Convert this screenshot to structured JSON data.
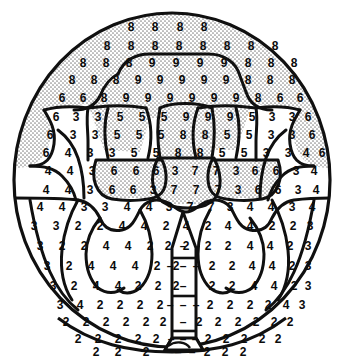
{
  "figure": {
    "kind": "paint-by-numbers-region-map",
    "outline_shape": "circle",
    "colors": {
      "ink": "#0b0b0b",
      "paper": "#ffffff",
      "stipple_fill": "#d9d9d9"
    },
    "legend_numbers": [
      "2",
      "3",
      "4",
      "5",
      "6",
      "7",
      "8",
      "9"
    ],
    "dash_mark": "–"
  },
  "regions": [
    {
      "id": "canopy-outer-top",
      "number": "8",
      "shaded": true,
      "name": "outer-canopy-top"
    },
    {
      "id": "canopy-inner-top",
      "number": "9",
      "shaded": true,
      "name": "inner-canopy-top"
    },
    {
      "id": "canopy-side-left",
      "number": "6",
      "shaded": true,
      "name": "canopy-side-left"
    },
    {
      "id": "canopy-side-right",
      "number": "6",
      "shaded": true,
      "name": "canopy-side-right"
    },
    {
      "id": "mid-left-3",
      "number": "3",
      "shaded": false,
      "name": "mid-band-left"
    },
    {
      "id": "mid-right-3",
      "number": "3",
      "shaded": false,
      "name": "mid-band-right"
    },
    {
      "id": "leaf-left-5",
      "number": "5",
      "shaded": false,
      "name": "leaf-cluster-left"
    },
    {
      "id": "leaf-right-5",
      "number": "5",
      "shaded": false,
      "name": "leaf-cluster-right"
    },
    {
      "id": "center-8",
      "number": "8",
      "shaded": true,
      "name": "center-upper-lobe"
    },
    {
      "id": "center-7",
      "number": "7",
      "shaded": true,
      "name": "center-lower-lobe"
    },
    {
      "id": "pod-left-6",
      "number": "6",
      "shaded": true,
      "name": "pod-left"
    },
    {
      "id": "pod-right-6",
      "number": "6",
      "shaded": true,
      "name": "pod-right"
    },
    {
      "id": "flank-left-4",
      "number": "4",
      "shaded": false,
      "name": "flank-left"
    },
    {
      "id": "flank-right-4",
      "number": "4",
      "shaded": false,
      "name": "flank-right"
    },
    {
      "id": "lower-left-4",
      "number": "4",
      "shaded": false,
      "name": "lower-cluster-left"
    },
    {
      "id": "lower-right-4",
      "number": "4",
      "shaded": false,
      "name": "lower-cluster-right"
    },
    {
      "id": "lower-left-2",
      "number": "2",
      "shaded": false,
      "name": "lower-field-left"
    },
    {
      "id": "lower-right-2",
      "number": "2",
      "shaded": false,
      "name": "lower-field-right"
    },
    {
      "id": "ground-2",
      "number": "2",
      "shaded": false,
      "name": "ground-field"
    },
    {
      "id": "trunk",
      "number": "–",
      "shaded": false,
      "name": "trunk-column"
    }
  ],
  "grid": {
    "rows": [
      {
        "y": 27,
        "cells": [
          {
            "x": 131,
            "v": "8"
          },
          {
            "x": 155,
            "v": "8"
          },
          {
            "x": 180,
            "v": "8"
          },
          {
            "x": 204,
            "v": "8"
          }
        ]
      },
      {
        "y": 46,
        "cells": [
          {
            "x": 107,
            "v": "8"
          },
          {
            "x": 131,
            "v": "8"
          },
          {
            "x": 155,
            "v": "8"
          },
          {
            "x": 179,
            "v": "8"
          },
          {
            "x": 203,
            "v": "8"
          },
          {
            "x": 227,
            "v": "8"
          },
          {
            "x": 251,
            "v": "8"
          },
          {
            "x": 275,
            "v": "8"
          }
        ]
      },
      {
        "y": 63,
        "cells": [
          {
            "x": 83,
            "v": "8"
          },
          {
            "x": 106,
            "v": "8"
          },
          {
            "x": 129,
            "v": "8"
          },
          {
            "x": 152,
            "v": "9"
          },
          {
            "x": 176,
            "v": "9"
          },
          {
            "x": 200,
            "v": "9"
          },
          {
            "x": 224,
            "v": "9"
          },
          {
            "x": 248,
            "v": "8"
          },
          {
            "x": 271,
            "v": "8"
          },
          {
            "x": 294,
            "v": "8"
          }
        ]
      },
      {
        "y": 80,
        "cells": [
          {
            "x": 72,
            "v": "8"
          },
          {
            "x": 94,
            "v": "8"
          },
          {
            "x": 116,
            "v": "8"
          },
          {
            "x": 138,
            "v": "9"
          },
          {
            "x": 160,
            "v": "9"
          },
          {
            "x": 182,
            "v": "9"
          },
          {
            "x": 204,
            "v": "9"
          },
          {
            "x": 226,
            "v": "9"
          },
          {
            "x": 248,
            "v": "8"
          },
          {
            "x": 270,
            "v": "8"
          },
          {
            "x": 292,
            "v": "8"
          }
        ]
      },
      {
        "y": 98,
        "cells": [
          {
            "x": 62,
            "v": "6"
          },
          {
            "x": 83,
            "v": "6"
          },
          {
            "x": 104,
            "v": "8"
          },
          {
            "x": 126,
            "v": "9"
          },
          {
            "x": 148,
            "v": "9"
          },
          {
            "x": 170,
            "v": "9"
          },
          {
            "x": 192,
            "v": "9"
          },
          {
            "x": 214,
            "v": "9"
          },
          {
            "x": 236,
            "v": "9"
          },
          {
            "x": 258,
            "v": "8"
          },
          {
            "x": 280,
            "v": "6"
          },
          {
            "x": 300,
            "v": "6"
          }
        ]
      },
      {
        "y": 117,
        "cells": [
          {
            "x": 56,
            "v": "6"
          },
          {
            "x": 76,
            "v": "3"
          },
          {
            "x": 98,
            "v": "3"
          },
          {
            "x": 120,
            "v": "5"
          },
          {
            "x": 142,
            "v": "5"
          },
          {
            "x": 164,
            "v": "5"
          },
          {
            "x": 186,
            "v": "9"
          },
          {
            "x": 208,
            "v": "9"
          },
          {
            "x": 230,
            "v": "9"
          },
          {
            "x": 252,
            "v": "5"
          },
          {
            "x": 272,
            "v": "3"
          },
          {
            "x": 292,
            "v": "3"
          },
          {
            "x": 308,
            "v": "6"
          }
        ]
      },
      {
        "y": 135,
        "cells": [
          {
            "x": 50,
            "v": "6"
          },
          {
            "x": 73,
            "v": "3"
          },
          {
            "x": 95,
            "v": "3"
          },
          {
            "x": 117,
            "v": "5"
          },
          {
            "x": 139,
            "v": "5"
          },
          {
            "x": 161,
            "v": "5"
          },
          {
            "x": 183,
            "v": "8"
          },
          {
            "x": 205,
            "v": "8"
          },
          {
            "x": 227,
            "v": "5"
          },
          {
            "x": 249,
            "v": "5"
          },
          {
            "x": 271,
            "v": "3"
          },
          {
            "x": 292,
            "v": "3"
          },
          {
            "x": 312,
            "v": "6"
          }
        ]
      },
      {
        "y": 153,
        "cells": [
          {
            "x": 46,
            "v": "6"
          },
          {
            "x": 68,
            "v": "4"
          },
          {
            "x": 90,
            "v": "3"
          },
          {
            "x": 112,
            "v": "3"
          },
          {
            "x": 134,
            "v": "5"
          },
          {
            "x": 156,
            "v": "5"
          },
          {
            "x": 178,
            "v": "8"
          },
          {
            "x": 200,
            "v": "8"
          },
          {
            "x": 222,
            "v": "5"
          },
          {
            "x": 244,
            "v": "5"
          },
          {
            "x": 266,
            "v": "3"
          },
          {
            "x": 288,
            "v": "3"
          },
          {
            "x": 306,
            "v": "4"
          },
          {
            "x": 322,
            "v": "6"
          }
        ]
      },
      {
        "y": 171,
        "cells": [
          {
            "x": 48,
            "v": "4"
          },
          {
            "x": 70,
            "v": "4"
          },
          {
            "x": 92,
            "v": "3"
          },
          {
            "x": 114,
            "v": "6"
          },
          {
            "x": 136,
            "v": "6"
          },
          {
            "x": 156,
            "v": "6"
          },
          {
            "x": 175,
            "v": "3"
          },
          {
            "x": 195,
            "v": "7"
          },
          {
            "x": 216,
            "v": "7"
          },
          {
            "x": 236,
            "v": "3"
          },
          {
            "x": 255,
            "v": "6"
          },
          {
            "x": 276,
            "v": "6"
          },
          {
            "x": 296,
            "v": "3"
          },
          {
            "x": 314,
            "v": "4"
          }
        ]
      },
      {
        "y": 190,
        "cells": [
          {
            "x": 46,
            "v": "4"
          },
          {
            "x": 68,
            "v": "4"
          },
          {
            "x": 90,
            "v": "3"
          },
          {
            "x": 112,
            "v": "6"
          },
          {
            "x": 133,
            "v": "6"
          },
          {
            "x": 153,
            "v": "3"
          },
          {
            "x": 174,
            "v": "7"
          },
          {
            "x": 196,
            "v": "7"
          },
          {
            "x": 218,
            "v": "7"
          },
          {
            "x": 238,
            "v": "3"
          },
          {
            "x": 258,
            "v": "6"
          },
          {
            "x": 278,
            "v": "6"
          },
          {
            "x": 298,
            "v": "3"
          },
          {
            "x": 316,
            "v": "4"
          }
        ]
      },
      {
        "y": 207,
        "cells": [
          {
            "x": 40,
            "v": "4"
          },
          {
            "x": 62,
            "v": "4"
          },
          {
            "x": 84,
            "v": "3"
          },
          {
            "x": 105,
            "v": "3"
          },
          {
            "x": 127,
            "v": "4"
          },
          {
            "x": 149,
            "v": "4"
          },
          {
            "x": 169,
            "v": "3"
          },
          {
            "x": 190,
            "v": "7"
          },
          {
            "x": 211,
            "v": "7"
          },
          {
            "x": 230,
            "v": "3"
          },
          {
            "x": 250,
            "v": "4"
          },
          {
            "x": 271,
            "v": "4"
          },
          {
            "x": 292,
            "v": "3"
          },
          {
            "x": 312,
            "v": "4"
          }
        ]
      },
      {
        "y": 226,
        "cells": [
          {
            "x": 34,
            "v": "3"
          },
          {
            "x": 56,
            "v": "3"
          },
          {
            "x": 78,
            "v": "2"
          },
          {
            "x": 100,
            "v": "2"
          },
          {
            "x": 122,
            "v": "4"
          },
          {
            "x": 144,
            "v": "4"
          },
          {
            "x": 166,
            "v": "2"
          },
          {
            "x": 186,
            "v": "4"
          },
          {
            "x": 208,
            "v": "2"
          },
          {
            "x": 228,
            "v": "4"
          },
          {
            "x": 250,
            "v": "4"
          },
          {
            "x": 272,
            "v": "2"
          },
          {
            "x": 293,
            "v": "2"
          },
          {
            "x": 310,
            "v": "3"
          }
        ]
      },
      {
        "y": 246,
        "cells": [
          {
            "x": 40,
            "v": "3"
          },
          {
            "x": 62,
            "v": "2"
          },
          {
            "x": 84,
            "v": "2"
          },
          {
            "x": 106,
            "v": "4"
          },
          {
            "x": 128,
            "v": "4"
          },
          {
            "x": 150,
            "v": "2"
          },
          {
            "x": 168,
            "v": "2"
          },
          {
            "x": 186,
            "v": "2"
          },
          {
            "x": 208,
            "v": "2"
          },
          {
            "x": 228,
            "v": "2"
          },
          {
            "x": 250,
            "v": "4"
          },
          {
            "x": 270,
            "v": "4"
          },
          {
            "x": 290,
            "v": "2"
          },
          {
            "x": 308,
            "v": "3"
          }
        ]
      },
      {
        "y": 266,
        "cells": [
          {
            "x": 47,
            "v": "3"
          },
          {
            "x": 69,
            "v": "2"
          },
          {
            "x": 91,
            "v": "4"
          },
          {
            "x": 113,
            "v": "4"
          },
          {
            "x": 135,
            "v": "4"
          },
          {
            "x": 157,
            "v": "2"
          },
          {
            "x": 176,
            "v": "2"
          },
          {
            "x": 212,
            "v": "2"
          },
          {
            "x": 232,
            "v": "2"
          },
          {
            "x": 252,
            "v": "4"
          },
          {
            "x": 272,
            "v": "4"
          },
          {
            "x": 292,
            "v": "2"
          },
          {
            "x": 308,
            "v": "3"
          }
        ]
      },
      {
        "y": 286,
        "cells": [
          {
            "x": 53,
            "v": "3"
          },
          {
            "x": 74,
            "v": "2"
          },
          {
            "x": 96,
            "v": "4"
          },
          {
            "x": 118,
            "v": "4"
          },
          {
            "x": 138,
            "v": "2"
          },
          {
            "x": 158,
            "v": "2"
          },
          {
            "x": 176,
            "v": "2"
          },
          {
            "x": 212,
            "v": "2"
          },
          {
            "x": 232,
            "v": "2"
          },
          {
            "x": 254,
            "v": "4"
          },
          {
            "x": 274,
            "v": "4"
          },
          {
            "x": 294,
            "v": "2"
          },
          {
            "x": 308,
            "v": "3"
          }
        ]
      },
      {
        "y": 305,
        "cells": [
          {
            "x": 60,
            "v": "3"
          },
          {
            "x": 80,
            "v": "4"
          },
          {
            "x": 100,
            "v": "2"
          },
          {
            "x": 120,
            "v": "2"
          },
          {
            "x": 140,
            "v": "2"
          },
          {
            "x": 160,
            "v": "2"
          },
          {
            "x": 210,
            "v": "2"
          },
          {
            "x": 230,
            "v": "2"
          },
          {
            "x": 250,
            "v": "2"
          },
          {
            "x": 268,
            "v": "2"
          },
          {
            "x": 286,
            "v": "4"
          },
          {
            "x": 302,
            "v": "3"
          }
        ]
      },
      {
        "y": 322,
        "cells": [
          {
            "x": 66,
            "v": "2"
          },
          {
            "x": 86,
            "v": "2"
          },
          {
            "x": 106,
            "v": "2"
          },
          {
            "x": 126,
            "v": "2"
          },
          {
            "x": 146,
            "v": "2"
          },
          {
            "x": 163,
            "v": "2"
          },
          {
            "x": 199,
            "v": "2"
          },
          {
            "x": 218,
            "v": "2"
          },
          {
            "x": 238,
            "v": "2"
          },
          {
            "x": 256,
            "v": "2"
          },
          {
            "x": 274,
            "v": "2"
          },
          {
            "x": 290,
            "v": "2"
          }
        ]
      },
      {
        "y": 339,
        "cells": [
          {
            "x": 78,
            "v": "2"
          },
          {
            "x": 98,
            "v": "2"
          },
          {
            "x": 118,
            "v": "2"
          },
          {
            "x": 138,
            "v": "2"
          },
          {
            "x": 156,
            "v": "2"
          },
          {
            "x": 208,
            "v": "2"
          },
          {
            "x": 226,
            "v": "2"
          },
          {
            "x": 244,
            "v": "2"
          },
          {
            "x": 262,
            "v": "2"
          },
          {
            "x": 278,
            "v": "2"
          }
        ]
      },
      {
        "y": 352,
        "cells": [
          {
            "x": 96,
            "v": "2"
          },
          {
            "x": 118,
            "v": "2"
          },
          {
            "x": 146,
            "v": "2"
          },
          {
            "x": 207,
            "v": "2"
          },
          {
            "x": 225,
            "v": "2"
          },
          {
            "x": 243,
            "v": "2"
          }
        ]
      }
    ],
    "trunk_marks": [
      {
        "x": 183,
        "y": 246,
        "v": "–"
      },
      {
        "x": 170,
        "y": 266,
        "v": "–"
      },
      {
        "x": 183,
        "y": 266,
        "v": "–"
      },
      {
        "x": 196,
        "y": 266,
        "v": "–"
      },
      {
        "x": 183,
        "y": 286,
        "v": "–"
      },
      {
        "x": 170,
        "y": 305,
        "v": "–"
      },
      {
        "x": 183,
        "y": 305,
        "v": "–"
      },
      {
        "x": 196,
        "y": 305,
        "v": "–"
      },
      {
        "x": 183,
        "y": 322,
        "v": "–"
      },
      {
        "x": 171,
        "y": 339,
        "v": "–"
      },
      {
        "x": 183,
        "y": 339,
        "v": "–"
      },
      {
        "x": 195,
        "y": 339,
        "v": "–"
      },
      {
        "x": 178,
        "y": 352,
        "v": "–"
      },
      {
        "x": 192,
        "y": 352,
        "v": "–"
      }
    ]
  }
}
